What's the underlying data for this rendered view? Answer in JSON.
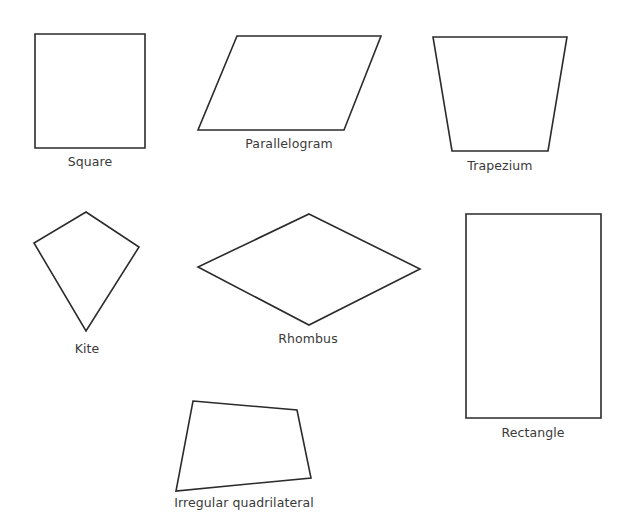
{
  "diagram": {
    "title": "",
    "stroke_color": "#2b2b2b",
    "label_color": "#3a3a3a",
    "background": "#ffffff",
    "shapes": [
      {
        "id": "square",
        "label": "Square",
        "points": "35,34 145,34 145,148 35,148",
        "label_pos": [
          90,
          157
        ]
      },
      {
        "id": "parallelogram",
        "label": "Parallelogram",
        "points": "237,36 381,36 344,130 198,130",
        "label_pos": [
          289,
          137
        ]
      },
      {
        "id": "trapezium",
        "label": "Trapezium",
        "points": "433,37 567,37 548,151 452,151",
        "label_pos": [
          500,
          159
        ]
      },
      {
        "id": "kite",
        "label": "Kite",
        "points": "86,212 139,247 86,331 34,243",
        "label_pos": [
          87,
          343
        ]
      },
      {
        "id": "rhombus",
        "label": "Rhombus",
        "points": "309,214 420,269 309,325 198,267",
        "label_pos": [
          308,
          333
        ]
      },
      {
        "id": "rectangle",
        "label": "Rectangle",
        "points": "466,214 601,214 601,418 466,418",
        "label_pos": [
          533,
          427
        ]
      },
      {
        "id": "irregular-quadrilateral",
        "label": "Irregular quadrilateral",
        "points": "193,401 297,410 311,478 176,491",
        "label_pos": [
          244,
          497
        ]
      }
    ]
  }
}
